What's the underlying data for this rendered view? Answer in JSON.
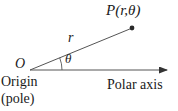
{
  "figure": {
    "background_color": "#ffffff",
    "stroke_color": "#4a4a4a",
    "text_color": "#1a1a1a",
    "labels": {
      "point": "P(r,θ)",
      "radius": "r",
      "angle": "θ",
      "origin_symbol": "O",
      "origin_word": "Origin",
      "pole_word": "(pole)",
      "polar_axis": "Polar axis"
    },
    "geometry": {
      "origin": {
        "x": 30,
        "y": 70
      },
      "point_p": {
        "x": 132,
        "y": 28
      },
      "axis_end": {
        "x": 172,
        "y": 70
      },
      "angle_arc_radius": 32,
      "angle_degrees": 22
    }
  }
}
